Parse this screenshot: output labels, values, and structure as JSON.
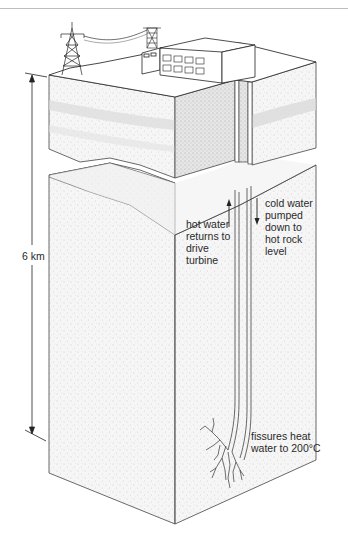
{
  "figure": {
    "labels": {
      "depth": "6 km",
      "hot_water": "hot water\nreturns to\ndrive\nturbine",
      "cold_water": "cold water\npumped\ndown to\nhot rock\nlevel",
      "fissures": "fissures heat\nwater to 200°C"
    },
    "elements": {
      "pylon": "electricity-pylon",
      "power_line": "transmission-line",
      "power_station": "power-station-building",
      "cooling_tower": "lattice-tower",
      "injection_pipe": "cold-water-pipe",
      "return_pipe": "hot-water-pipe",
      "fractures": "rock-fissures"
    },
    "arrows": {
      "hot_water_direction": "up",
      "cold_water_direction": "down",
      "depth_dimension": "double-headed vertical"
    },
    "colors": {
      "line": "#333333",
      "rock_fill": "#f4f4f4",
      "stipple": "#b8b8b8",
      "band": "#d9d9d9",
      "top_rule": "#bdbdbd"
    }
  }
}
